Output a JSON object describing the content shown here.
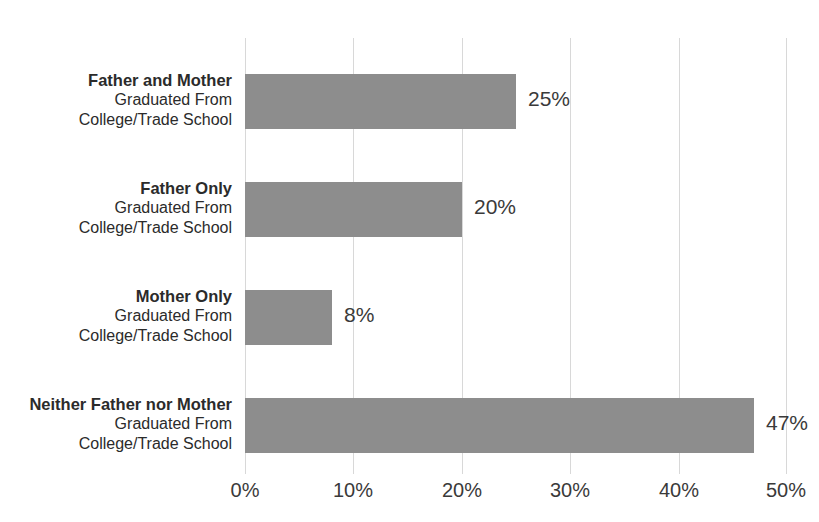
{
  "chart_data": {
    "type": "bar",
    "orientation": "horizontal",
    "title": "",
    "xlabel": "",
    "ylabel": "",
    "xlim": [
      0,
      50
    ],
    "xticks": [
      "0%",
      "10%",
      "20%",
      "30%",
      "40%",
      "50%"
    ],
    "xtick_values": [
      0,
      10,
      20,
      30,
      40,
      50
    ],
    "grid": "vertical",
    "legend": "none",
    "bar_color": "#8d8d8d",
    "gridline_color": "#d8d8d8",
    "text_color": "#3a3a3a",
    "categories": [
      "Father and Mother Graduated From College/Trade School",
      "Father Only Graduated From College/Trade School",
      "Mother Only Graduated From College/Trade School",
      "Neither Father nor Mother Graduated From College/Trade School"
    ],
    "values": [
      25,
      20,
      8,
      47
    ],
    "value_labels": [
      "25%",
      "20%",
      "8%",
      "47%"
    ],
    "category_lines": [
      {
        "title": "Father and Mother",
        "line2": "Graduated From",
        "line3": "College/Trade School"
      },
      {
        "title": "Father Only",
        "line2": "Graduated From",
        "line3": "College/Trade School"
      },
      {
        "title": "Mother Only",
        "line2": "Graduated From",
        "line3": "College/Trade School"
      },
      {
        "title": "Neither Father nor Mother",
        "line2": "Graduated From",
        "line3": "College/Trade School"
      }
    ]
  }
}
